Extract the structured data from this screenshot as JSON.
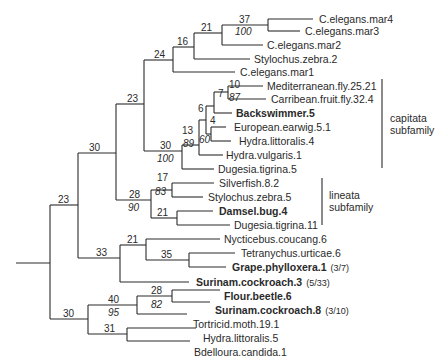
{
  "tree": {
    "leaves": [
      {
        "label": "C.elegans.mar4",
        "bold": false,
        "note": ""
      },
      {
        "label": "C.elegans.mar3",
        "bold": false,
        "note": ""
      },
      {
        "label": "C.elegans.mar2",
        "bold": false,
        "note": ""
      },
      {
        "label": "Stylochus.zebra.2",
        "bold": false,
        "note": ""
      },
      {
        "label": "C.elegans.mar1",
        "bold": false,
        "note": ""
      },
      {
        "label": "Mediterranean.fly.25.21",
        "bold": false,
        "note": ""
      },
      {
        "label": "Carribean.fruit.fly.32.4",
        "bold": false,
        "note": ""
      },
      {
        "label": "Backswimmer.5",
        "bold": true,
        "note": ""
      },
      {
        "label": "European.earwig.5.1",
        "bold": false,
        "note": ""
      },
      {
        "label": "Hydra.littoralis.4",
        "bold": false,
        "note": ""
      },
      {
        "label": "Hydra.vulgaris.1",
        "bold": false,
        "note": ""
      },
      {
        "label": "Dugesia.tigrina.5",
        "bold": false,
        "note": ""
      },
      {
        "label": "Silverfish.8.2",
        "bold": false,
        "note": ""
      },
      {
        "label": "Stylochus.zebra.5",
        "bold": false,
        "note": ""
      },
      {
        "label": "Damsel.bug.4",
        "bold": true,
        "note": ""
      },
      {
        "label": "Dugesia.tigrina.11",
        "bold": false,
        "note": ""
      },
      {
        "label": "Nycticebus.coucang.6",
        "bold": false,
        "note": ""
      },
      {
        "label": "Tetranychus.urticae.6",
        "bold": false,
        "note": ""
      },
      {
        "label": "Grape.phylloxera.1",
        "bold": true,
        "note": "(3/7)"
      },
      {
        "label": "Surinam.cockroach.3",
        "bold": true,
        "note": "(5/33)"
      },
      {
        "label": "Flour.beetle.6",
        "bold": true,
        "note": ""
      },
      {
        "label": "Surinam.cockroach.8",
        "bold": true,
        "note": "(3/10)"
      },
      {
        "label": "Tortricid.moth.19.1",
        "bold": false,
        "note": ""
      },
      {
        "label": "Hydra.littoralis.5",
        "bold": false,
        "note": ""
      },
      {
        "label": "Bdelloura.candida.1",
        "bold": false,
        "note": ""
      }
    ],
    "node_labels": {
      "n37": "37",
      "n37_boot": "100",
      "n21a": "21",
      "n16": "16",
      "n24": "24",
      "n10": "10",
      "n10_boot": "87",
      "n7": "7",
      "n6": "6",
      "n4": "4",
      "n4_boot": "60",
      "n13": "13",
      "n13_boot": "89",
      "n30a": "30",
      "n30a_boot": "100",
      "n23a": "23",
      "n17": "17",
      "n17_boot": "83",
      "n21b": "21",
      "n28a": "28",
      "n28a_boot": "90",
      "n30b": "30",
      "n35": "35",
      "n21c": "21",
      "n33": "33",
      "n23root": "23",
      "n28b": "28",
      "n28b_boot": "82",
      "n40": "40",
      "n40_boot": "95",
      "n31": "31",
      "n30c": "30"
    },
    "groups": [
      {
        "line1": "capitata",
        "line2": "subfamily"
      },
      {
        "line1": "lineata",
        "line2": "subfamily"
      }
    ]
  }
}
